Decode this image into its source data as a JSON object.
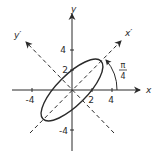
{
  "figure": {
    "type": "rotated-ellipse-axes-diagram",
    "axes": {
      "x_label": "x",
      "y_label": "y",
      "x_prime_label": "x′",
      "y_prime_label": "y′"
    },
    "ticks": {
      "x": [
        {
          "value": -4,
          "label": "-4"
        },
        {
          "value": 2,
          "label": "2"
        },
        {
          "value": 4,
          "label": "4"
        }
      ],
      "y": [
        {
          "value": 4,
          "label": "4"
        },
        {
          "value": 2,
          "label": "2"
        },
        {
          "value": -4,
          "label": "-4"
        }
      ]
    },
    "rotation_angle": {
      "numerator": "π",
      "denominator": "4"
    },
    "ellipse": {
      "center": [
        0,
        0
      ],
      "rotation_deg": 45,
      "semi_major": 4,
      "semi_minor": 1.6
    },
    "colors": {
      "stroke": "#2a2a2a",
      "background": "#ffffff"
    }
  }
}
